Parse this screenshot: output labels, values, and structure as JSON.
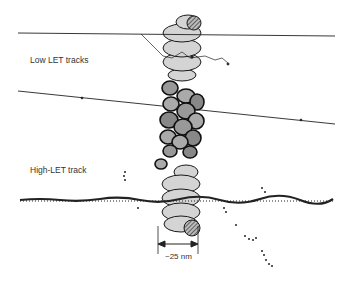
{
  "labels": {
    "low_let": "Low LET tracks",
    "high_let": "High-LET track",
    "scale": "~25 nm"
  },
  "colors": {
    "background": "#ffffff",
    "fiber_fill": "#d4d4d4",
    "outline": "#1a1a1a",
    "track": "#222222",
    "text": "#333333"
  },
  "elements": [
    "upper-solenoid-chromatin",
    "condensed-nucleosome-cluster",
    "lower-solenoid-chromatin",
    "low-let-track-1",
    "low-let-track-2",
    "high-let-track",
    "delta-ray-branches",
    "scale-bar"
  ]
}
